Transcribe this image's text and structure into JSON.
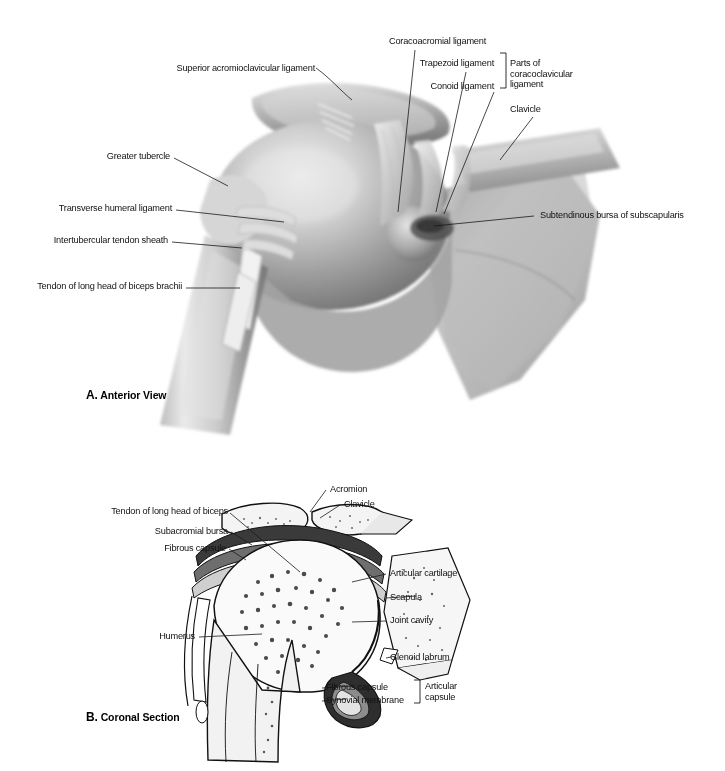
{
  "figure": {
    "title_visible": false,
    "background": "#ffffff",
    "ink": "#111111",
    "style": "grayscale anatomical illustration"
  },
  "panel_a": {
    "caption_letter": "A.",
    "caption_text": "Anterior View",
    "labels": {
      "superior_acromioclavicular_ligament": "Superior acromioclavicular ligament",
      "coracoacromial_ligament": "Coracoacromial ligament",
      "trapezoid_ligament": "Trapezoid ligament",
      "conoid_ligament": "Conoid ligament",
      "parts_of_coracoclavicular_ligament": "Parts of coracoclavicular ligament",
      "clavicle": "Clavicle",
      "greater_tubercle": "Greater tubercle",
      "transverse_humeral_ligament": "Transverse humeral ligament",
      "intertubercular_tendon_sheath": "Intertubercular tendon sheath",
      "tendon_of_long_head_of_biceps_brachii": "Tendon of long head of biceps brachii",
      "subtendinous_bursa_of_subscapularis": "Subtendinous bursa of subscapularis"
    }
  },
  "panel_b": {
    "caption_letter": "B.",
    "caption_text": "Coronal Section",
    "labels": {
      "tendon_of_long_head_of_biceps": "Tendon of long head of biceps",
      "subacromial_bursa": "Subacromial bursa",
      "fibrous_capsule_top": "Fibrous capsule",
      "acromion": "Acromion",
      "clavicle": "Clavicle",
      "articular_cartilage": "Articular cartilage",
      "scapula": "Scapula",
      "joint_cavity": "Joint cavity",
      "glenoid_labrum": "Glenoid labrum",
      "humerus": "Humerus",
      "fibrous_capsule_bottom": "Fibrous capsule",
      "synovial_membrane": "Synovial membrane",
      "articular_capsule": "Articular capsule"
    }
  }
}
